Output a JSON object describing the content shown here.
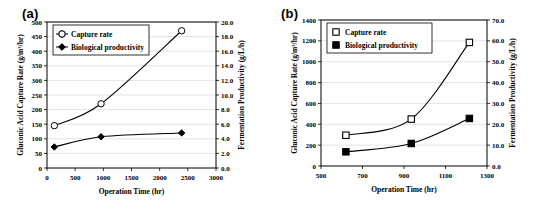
{
  "figure": {
    "panels": [
      {
        "label": "(a)",
        "xlabel": "Operation Time (hr)",
        "ylabel_left": "Gluconic Acid Capture Rate (g/m³/hr)",
        "ylabel_right": "Fermentation Productivity (g/L/h)",
        "xticks": [
          "0",
          "500",
          "1000",
          "1500",
          "2000",
          "2500",
          "3000"
        ],
        "yticks_left": [
          "0",
          "50",
          "100",
          "150",
          "200",
          "250",
          "300",
          "350",
          "400",
          "450",
          "500"
        ],
        "yticks_right": [
          "0.0",
          "2.0",
          "4.0",
          "6.0",
          "8.0",
          "10.0",
          "12.0",
          "14.0",
          "16.0",
          "18.0",
          "20.0"
        ],
        "legend": [
          "Capture rate",
          "Biological productivity"
        ],
        "chart_data": {
          "type": "line",
          "title": "(a)",
          "xlabel": "Operation Time (hr)",
          "ylabel": "Gluconic Acid Capture Rate (g/m³/hr)",
          "ylabel_secondary": "Fermentation Productivity (g/L/h)",
          "xlim": [
            0,
            3000
          ],
          "ylim": [
            0,
            500
          ],
          "ylim_secondary": [
            0.0,
            20.0
          ],
          "grid": true,
          "legend_position": "top-left",
          "x": [
            130,
            960,
            2390
          ],
          "series": [
            {
              "name": "Capture rate",
              "axis": "left",
              "marker": "open-circle",
              "values": [
                145,
                220,
                470
              ]
            },
            {
              "name": "Biological productivity",
              "axis": "right",
              "marker": "filled-diamond",
              "values": [
                2.9,
                4.3,
                4.8
              ],
              "values_left_scale": [
                72,
                107,
                120
              ]
            }
          ]
        }
      },
      {
        "label": "(b)",
        "xlabel": "Operation Time (hr)",
        "ylabel_left": "Gluconic Acid Capture Rate (g/m³/hr)",
        "ylabel_right": "Fermentation Productivity (g/L/h)",
        "xticks": [
          "500",
          "700",
          "900",
          "1100",
          "1300"
        ],
        "yticks_left": [
          "0",
          "200",
          "400",
          "600",
          "800",
          "1000",
          "1200",
          "1400"
        ],
        "yticks_right": [
          "0.0",
          "10.0",
          "20.0",
          "30.0",
          "40.0",
          "50.0",
          "60.0",
          "70.0"
        ],
        "legend": [
          "Capture rate",
          "Biological productivity"
        ],
        "chart_data": {
          "type": "line",
          "title": "(b)",
          "xlabel": "Operation Time (hr)",
          "ylabel": "Gluconic Acid Capture Rate (g/m³/hr)",
          "ylabel_secondary": "Fermentation Productivity (g/L/h)",
          "xlim": [
            500,
            1300
          ],
          "ylim": [
            0,
            1400
          ],
          "ylim_secondary": [
            0.0,
            70.0
          ],
          "grid": true,
          "legend_position": "top-left",
          "x": [
            620,
            935,
            1215
          ],
          "series": [
            {
              "name": "Capture rate",
              "axis": "left",
              "marker": "open-square",
              "values": [
                295,
                450,
                1185
              ]
            },
            {
              "name": "Biological productivity",
              "axis": "right",
              "marker": "filled-square",
              "values": [
                6.8,
                10.8,
                22.8
              ],
              "values_left_scale": [
                136,
                216,
                456
              ]
            }
          ]
        }
      }
    ]
  }
}
